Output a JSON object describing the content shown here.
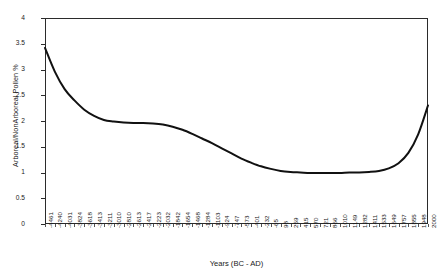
{
  "chart_data": {
    "type": "line",
    "title": "",
    "xlabel": "Years (BC - AD)",
    "ylabel": "Arboreal/NonArboreal Pollen %",
    "ylim": [
      0,
      4
    ],
    "yticks": [
      0,
      0.5,
      1,
      1.5,
      2,
      2.5,
      3,
      3.5,
      4
    ],
    "ytick_labels": [
      "0",
      "0.5",
      "1",
      "1.5",
      "2",
      "2.5",
      "3",
      "3.5",
      "4"
    ],
    "grid": false,
    "legend": "none",
    "line_color": "#111111",
    "line_width": 2.0,
    "categories": [
      "-4461",
      "-4240",
      "-4031",
      "-3824",
      "-3618",
      "-3413",
      "-3211",
      "-3010",
      "-2810",
      "-2613",
      "-2417",
      "-2223",
      "-2032",
      "-1842",
      "-1654",
      "-1468",
      "-1284",
      "-1103",
      "-924",
      "-747",
      "-573",
      "-401",
      "-232",
      "-65",
      "98",
      "259",
      "415",
      "570",
      "721",
      "866",
      "1010",
      "1149",
      "1282",
      "1411",
      "1533",
      "1649",
      "1757",
      "1855",
      "1948",
      "2000"
    ],
    "values": [
      3.42,
      2.96,
      2.62,
      2.4,
      2.22,
      2.1,
      2.02,
      1.99,
      1.97,
      1.96,
      1.96,
      1.95,
      1.93,
      1.89,
      1.83,
      1.75,
      1.66,
      1.57,
      1.47,
      1.37,
      1.27,
      1.19,
      1.12,
      1.07,
      1.03,
      1.01,
      1.0,
      0.99,
      0.99,
      0.99,
      0.99,
      1.0,
      1.0,
      1.01,
      1.03,
      1.08,
      1.18,
      1.38,
      1.74,
      2.3
    ]
  }
}
